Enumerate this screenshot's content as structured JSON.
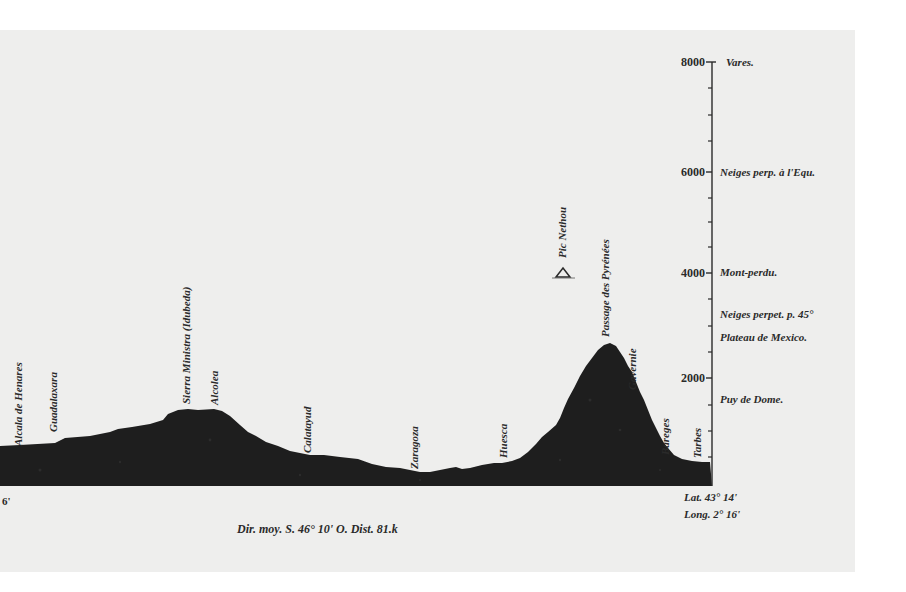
{
  "figure": {
    "type": "elevation-profile",
    "axis": {
      "ticks": [
        {
          "value": "8000",
          "y": 62
        },
        {
          "value": "6000",
          "y": 172
        },
        {
          "value": "4000",
          "y": 273
        },
        {
          "value": "2000",
          "y": 378
        }
      ],
      "minor_tick_interval": 500
    },
    "reference_heights": [
      {
        "label": "Vares.",
        "y": 66
      },
      {
        "label": "Neiges perp. à l'Equ.",
        "y": 176
      },
      {
        "label": "Mont-perdu.",
        "y": 276
      },
      {
        "label": "Neiges perpet. p. 45°",
        "y": 318
      },
      {
        "label": "Plateau de Mexico.",
        "y": 341
      },
      {
        "label": "Puy de Dome.",
        "y": 403
      }
    ],
    "places": [
      {
        "label": "Alcala de Henares",
        "x": 22,
        "y_base": 446
      },
      {
        "label": "Guadalaxara",
        "x": 57,
        "y_base": 432
      },
      {
        "label": "Sierra Ministra (Idubeda)",
        "x": 190,
        "y_base": 404
      },
      {
        "label": "Alcolea",
        "x": 218,
        "y_base": 405
      },
      {
        "label": "Calatayud",
        "x": 311,
        "y_base": 453
      },
      {
        "label": "Zaragoza",
        "x": 418,
        "y_base": 469
      },
      {
        "label": "Huesca",
        "x": 507,
        "y_base": 458
      },
      {
        "label": "Pic Nethou",
        "x": 566,
        "y_base": 258
      },
      {
        "label": "Passage des Pyrénées",
        "x": 609,
        "y_base": 337
      },
      {
        "label": "Gavernie",
        "x": 636,
        "y_base": 390
      },
      {
        "label": "Bareges",
        "x": 669,
        "y_base": 455
      },
      {
        "label": "Tarbes",
        "x": 701,
        "y_base": 458
      }
    ],
    "coordinates": {
      "lat": "Lat. 43° 14'",
      "long": "Long. 2° 16'"
    },
    "caption": "Dir. moy. S. 46° 10' O. Dist. 81.k",
    "colors": {
      "ink": "#1e1e1e",
      "paper": "#eeeeed",
      "text": "#2a2a2a"
    }
  }
}
